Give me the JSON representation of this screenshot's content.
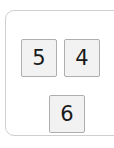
{
  "panel": {
    "name": "number-tile-panel",
    "border_color": "#d0d0d0",
    "background_color": "#ffffff",
    "corner_radius_px": 9
  },
  "tiles": {
    "fill_color": "#f2f2f2",
    "border_color": "#aeaeae",
    "text_color": "#1a1a1a",
    "items": [
      {
        "label": "5",
        "row": 1,
        "column": 1
      },
      {
        "label": "4",
        "row": 1,
        "column": 2
      },
      {
        "label": "6",
        "row": 2,
        "column": 1
      }
    ]
  }
}
